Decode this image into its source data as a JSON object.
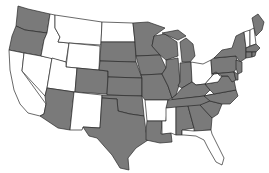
{
  "map": {
    "title": "",
    "region": "Contiguous United States",
    "colors": {
      "highlighted": "#7a7a7a",
      "not_highlighted": "#ffffff",
      "border": "#2a2a2a"
    },
    "highlighted_states": [
      "WA",
      "OR",
      "CO",
      "AZ",
      "TX",
      "OK",
      "KS",
      "NE",
      "SD",
      "MN",
      "IA",
      "MO",
      "WI",
      "IL",
      "MI",
      "IN",
      "LA",
      "KY",
      "TN",
      "AL",
      "GA",
      "SC",
      "NC",
      "VA",
      "PA",
      "NY",
      "ME",
      "NJ",
      "MD",
      "DE",
      "MA",
      "CT",
      "RI"
    ],
    "not_highlighted_states": [
      "CA",
      "NV",
      "ID",
      "MT",
      "WY",
      "UT",
      "NM",
      "ND",
      "AR",
      "MS",
      "FL",
      "OH",
      "WV",
      "VT",
      "NH"
    ]
  }
}
